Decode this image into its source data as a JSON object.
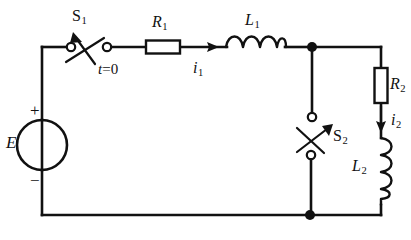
{
  "diagram": {
    "type": "electrical-schematic",
    "canvas": {
      "width": 411,
      "height": 240
    },
    "colors": {
      "line": "#111111",
      "background": "#ffffff"
    }
  },
  "labels": {
    "source_E": "E",
    "source_plus": "+",
    "source_minus": "−",
    "switch_S1": "S",
    "switch_S1_sub": "1",
    "switch_time": "t",
    "switch_time_value": "=0",
    "resistor_R1": "R",
    "resistor_R1_sub": "1",
    "current_i1": "i",
    "current_i1_sub": "1",
    "inductor_L1": "L",
    "inductor_L1_sub": "1",
    "switch_S2": "S",
    "switch_S2_sub": "2",
    "resistor_R2": "R",
    "resistor_R2_sub": "2",
    "current_i2": "i",
    "current_i2_sub": "2",
    "inductor_L2": "L",
    "inductor_L2_sub": "2"
  },
  "components": [
    {
      "id": "source-E",
      "kind": "voltage-source",
      "label": "E",
      "orientation": "vertical",
      "polarity": "plus-top"
    },
    {
      "id": "switch-S1",
      "kind": "switch",
      "label": "S1",
      "orientation": "horizontal",
      "state": "open",
      "note": "t=0"
    },
    {
      "id": "resistor-R1",
      "kind": "resistor",
      "label": "R1",
      "orientation": "horizontal"
    },
    {
      "id": "inductor-L1",
      "kind": "inductor",
      "label": "L1",
      "orientation": "horizontal",
      "humps": 4
    },
    {
      "id": "switch-S2",
      "kind": "switch",
      "label": "S2",
      "orientation": "vertical",
      "state": "open"
    },
    {
      "id": "resistor-R2",
      "kind": "resistor",
      "label": "R2",
      "orientation": "vertical"
    },
    {
      "id": "inductor-L2",
      "kind": "inductor",
      "label": "L2",
      "orientation": "vertical",
      "humps": 4
    }
  ],
  "currents": [
    {
      "id": "current-i1",
      "label": "i1",
      "direction": "rightward",
      "branch": "top-series"
    },
    {
      "id": "current-i2",
      "label": "i2",
      "direction": "downward",
      "branch": "right-series"
    }
  ],
  "nodes": [
    {
      "id": "node-top-right",
      "x": 312,
      "y": 47,
      "junction": true
    },
    {
      "id": "node-bottom-right",
      "x": 310,
      "y": 215,
      "junction": true
    }
  ]
}
